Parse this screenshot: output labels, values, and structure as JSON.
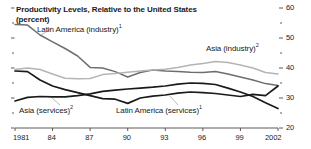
{
  "chart_data": {
    "type": "line",
    "title": "Productivity Levels, Relative to the United States",
    "subtitle": "(percent)",
    "xlabel": "",
    "ylabel": "",
    "xlim": [
      1981,
      2002
    ],
    "ylim": [
      20,
      60
    ],
    "grid": false,
    "legend": "inline-annotations",
    "y_ticks_major": [
      "60",
      "50",
      "40",
      "30",
      "20"
    ],
    "y_tick_values": [
      60,
      50,
      40,
      30,
      20
    ],
    "y_minor_ticks": [
      55,
      45,
      35,
      25
    ],
    "x_ticks": [
      "1981",
      "84",
      "87",
      "90",
      "93",
      "96",
      "99",
      "2002"
    ],
    "x_tick_values": [
      1981,
      1984,
      1987,
      1990,
      1993,
      1996,
      1999,
      2002
    ],
    "x": [
      1981,
      1982,
      1983,
      1984,
      1985,
      1986,
      1987,
      1988,
      1989,
      1990,
      1991,
      1992,
      1993,
      1994,
      1995,
      1996,
      1997,
      1998,
      1999,
      2000,
      2001,
      2002
    ],
    "series": [
      {
        "name": "Latin America (industry)",
        "footnote": "1",
        "color": "#6e6e6e",
        "width": 1.5,
        "label_text": "Latin America (industry)",
        "values": [
          54.5,
          54.3,
          51.0,
          48.7,
          46.5,
          44.0,
          40.2,
          40.0,
          38.8,
          37.0,
          38.5,
          39.3,
          39.0,
          38.8,
          38.6,
          38.5,
          38.8,
          38.0,
          37.0,
          36.0,
          34.8,
          34.2
        ]
      },
      {
        "name": "Asia (industry)",
        "footnote": "2",
        "color": "#b4b4b4",
        "width": 1.5,
        "label_text": "Asia (industry)",
        "values": [
          39.5,
          40.0,
          39.5,
          38.0,
          36.6,
          36.4,
          36.5,
          37.8,
          38.2,
          38.6,
          39.0,
          39.3,
          39.6,
          40.2,
          41.0,
          41.5,
          42.2,
          41.8,
          41.0,
          40.0,
          38.5,
          38.0
        ]
      },
      {
        "name": "Latin America (services)",
        "footnote": "1",
        "color": "#1a1a1a",
        "width": 1.7,
        "label_text": "Latin America (services)",
        "values": [
          39.0,
          38.8,
          36.0,
          34.0,
          32.8,
          31.8,
          30.8,
          29.8,
          29.6,
          28.2,
          30.0,
          30.6,
          31.0,
          31.6,
          32.0,
          31.8,
          31.5,
          31.0,
          30.5,
          31.2,
          30.8,
          34.0
        ]
      },
      {
        "name": "Asia (services)",
        "footnote": "2",
        "color": "#1a1a1a",
        "width": 1.7,
        "label_text": "Asia (services)",
        "values": [
          29.0,
          30.2,
          30.5,
          30.4,
          30.4,
          30.8,
          31.4,
          32.2,
          32.6,
          33.0,
          33.3,
          33.6,
          34.0,
          34.6,
          35.0,
          34.9,
          34.5,
          33.3,
          32.0,
          30.5,
          28.4,
          26.5
        ]
      }
    ]
  },
  "axis": {
    "y_major_labels": [
      {
        "text": "60",
        "value": 60
      },
      {
        "text": "50",
        "value": 50
      },
      {
        "text": "40",
        "value": 40
      },
      {
        "text": "30",
        "value": 30
      },
      {
        "text": "20",
        "value": 20
      }
    ],
    "x_labels": [
      {
        "text": "1981",
        "value": 1981
      },
      {
        "text": "84",
        "value": 1984
      },
      {
        "text": "87",
        "value": 1987
      },
      {
        "text": "90",
        "value": 1990
      },
      {
        "text": "93",
        "value": 1993
      },
      {
        "text": "96",
        "value": 1996
      },
      {
        "text": "99",
        "value": 1999
      },
      {
        "text": "2002",
        "value": 2002
      }
    ]
  },
  "annotations": {
    "latin_america_industry": {
      "text": "Latin America (industry)",
      "sup": "1"
    },
    "asia_industry": {
      "text": "Asia (industry)",
      "sup": "2"
    },
    "asia_services": {
      "text": "Asia (services)",
      "sup": "2"
    },
    "latin_america_services": {
      "text": "Latin America (services)",
      "sup": "1"
    }
  },
  "colors": {
    "dark_line": "#1a1a1a",
    "mid_line": "#6e6e6e",
    "light_line": "#b4b4b4",
    "axis": "#5a5a5a",
    "background": "#ffffff"
  }
}
